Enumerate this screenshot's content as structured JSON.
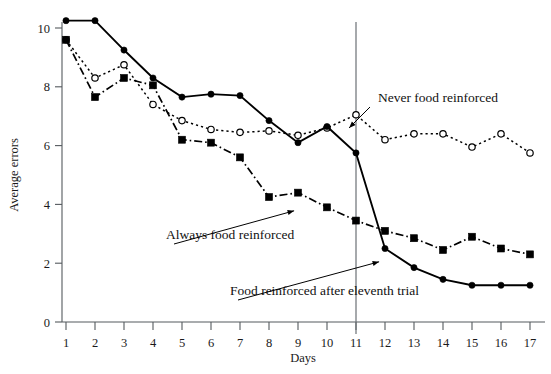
{
  "figure": {
    "background_color": "#ffffff",
    "ink_color": "#000000",
    "axis_color": "#555a5e"
  },
  "chart_data": {
    "type": "line",
    "title": "",
    "subtitle": "",
    "xlabel": "Days",
    "ylabel": "Average errors",
    "xlim": [
      0.4,
      17.6
    ],
    "ylim": [
      0,
      10.9
    ],
    "x": [
      1,
      2,
      3,
      4,
      5,
      6,
      7,
      8,
      9,
      10,
      11,
      12,
      13,
      14,
      15,
      16,
      17
    ],
    "xticks": [
      "1",
      "2",
      "3",
      "4",
      "5",
      "6",
      "7",
      "8",
      "9",
      "10",
      "11",
      "12",
      "13",
      "14",
      "15",
      "16",
      "17"
    ],
    "yticks": [
      "0",
      "2",
      "4",
      "6",
      "8",
      "10"
    ],
    "ytick_values": [
      0,
      2,
      4,
      6,
      8,
      10
    ],
    "grid": false,
    "legend_position": "inline-annotations",
    "series": [
      {
        "name": "Never food reinforced",
        "marker": "open-circle",
        "linestyle": "dotted",
        "color": "#000000",
        "values": [
          9.6,
          8.3,
          8.75,
          7.4,
          6.85,
          6.55,
          6.45,
          6.5,
          6.35,
          6.6,
          7.05,
          6.2,
          6.4,
          6.4,
          5.95,
          6.4,
          5.75
        ]
      },
      {
        "name": "Always food reinforced",
        "marker": "filled-square",
        "linestyle": "dash-dot",
        "color": "#000000",
        "values": [
          9.6,
          7.65,
          8.3,
          8.05,
          6.2,
          6.1,
          5.6,
          4.25,
          4.4,
          3.9,
          3.45,
          3.1,
          2.85,
          2.45,
          2.9,
          2.5,
          2.3
        ]
      },
      {
        "name": "Food reinforced after eleventh trial",
        "marker": "filled-circle",
        "linestyle": "solid",
        "color": "#000000",
        "values": [
          10.25,
          10.25,
          9.25,
          8.3,
          7.65,
          7.75,
          7.7,
          6.85,
          6.1,
          6.65,
          5.75,
          2.5,
          1.85,
          1.45,
          1.25,
          1.25,
          1.25
        ]
      }
    ],
    "annotations": [
      {
        "label": "Never food reinforced",
        "text_x": 378,
        "text_y": 102,
        "target_x": 347,
        "target_y": 130
      },
      {
        "label": "Always food reinforced",
        "text_x": 166,
        "text_y": 239,
        "target_x": 297,
        "target_y": 210
      },
      {
        "label": "Food reinforced after eleventh trial",
        "text_x": 230,
        "text_y": 295,
        "target_x": 382,
        "target_y": 261
      }
    ],
    "vertical_divider_at_x": 11
  }
}
